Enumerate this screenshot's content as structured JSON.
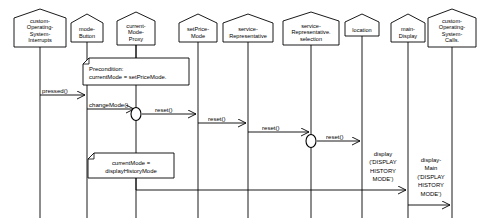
{
  "diagram": {
    "type": "sequence-diagram",
    "background_color": "#ffffff",
    "line_color": "#000000"
  },
  "objects": [
    {
      "id": "cosi",
      "label_lines": [
        "custom-",
        "Operating-",
        "System-",
        "Interrupts"
      ],
      "x": 40,
      "box_w": 52,
      "box_h": 38
    },
    {
      "id": "modebutton",
      "label_lines": [
        "mode-",
        "Button"
      ],
      "x": 87,
      "box_w": 32,
      "box_h": 28
    },
    {
      "id": "modeproxy",
      "label_lines": [
        "current-",
        "Mode-",
        "Proxy"
      ],
      "x": 136,
      "box_w": 38,
      "box_h": 33
    },
    {
      "id": "setprice",
      "label_lines": [
        "setPrice-",
        "Mode"
      ],
      "x": 198,
      "box_w": 38,
      "box_h": 28
    },
    {
      "id": "servicerep",
      "label_lines": [
        "service-",
        "Representative"
      ],
      "x": 248,
      "box_w": 50,
      "box_h": 28
    },
    {
      "id": "servicesel",
      "label_lines": [
        "service-",
        "Representative.",
        "selection"
      ],
      "x": 311,
      "box_w": 56,
      "box_h": 33
    },
    {
      "id": "location",
      "label_lines": [
        "location"
      ],
      "x": 362,
      "box_w": 34,
      "box_h": 22
    },
    {
      "id": "maindisplay",
      "label_lines": [
        "main-",
        "Display"
      ],
      "x": 408,
      "box_w": 34,
      "box_h": 28
    },
    {
      "id": "cosc",
      "label_lines": [
        "custom-",
        "Operating-",
        "System-",
        "Calls."
      ],
      "x": 452,
      "box_w": 48,
      "box_h": 38
    }
  ],
  "messages": [
    {
      "id": "pressed",
      "label": "pressed()",
      "from": "cosi",
      "to": "modebutton",
      "y": 95,
      "orientation": "horizontal"
    },
    {
      "id": "changemode",
      "label": "changeMode()",
      "from": "modebutton",
      "to": "modeproxy",
      "y": 104,
      "orientation": "horizontal"
    },
    {
      "id": "reset1",
      "label": "reset()",
      "from": "modeproxy",
      "to": "setprice",
      "y": 113,
      "orientation": "horizontal"
    },
    {
      "id": "reset2",
      "label": "reset()",
      "from": "setprice",
      "to": "servicerep",
      "y": 124,
      "orientation": "horizontal"
    },
    {
      "id": "reset3",
      "label": "reset()",
      "from": "servicerep",
      "to": "servicesel",
      "y": 133,
      "orientation": "horizontal"
    },
    {
      "id": "reset4",
      "label": "reset()",
      "from": "servicesel",
      "to": "location",
      "y": 141,
      "orientation": "horizontal"
    },
    {
      "id": "display",
      "label_lines": [
        "display",
        "('DISPLAY",
        "HISTORY",
        "MODE')"
      ],
      "from": "modeproxy",
      "to": "maindisplay",
      "y": 188,
      "orientation": "horizontal"
    },
    {
      "id": "displaymain",
      "label_lines": [
        "display-",
        "Main",
        "('DISPLAY",
        "HISTORY",
        "MODE')"
      ],
      "from": "maindisplay",
      "to": "cosc",
      "y": 200,
      "orientation": "horizontal"
    }
  ],
  "notes": [
    {
      "id": "precondition-note",
      "lines": [
        "Precondition:",
        "currentMode = setPriceMode."
      ],
      "x": 83,
      "y": 58,
      "w": 106,
      "h": 27,
      "anchor_lifeline": "modeproxy"
    },
    {
      "id": "currentmode-note",
      "lines": [
        "currentMode =",
        "displayHistoryMode"
      ],
      "x": 88,
      "y": 153,
      "w": 86,
      "h": 25,
      "anchor_lifeline": "modeproxy"
    }
  ],
  "activation_marks": [
    {
      "id": "mark-modeproxy",
      "lifeline": "modeproxy",
      "y": 113,
      "rx": 5,
      "ry": 6.5
    },
    {
      "id": "mark-servicesel",
      "lifeline": "servicesel",
      "y": 141,
      "rx": 5,
      "ry": 6.5
    }
  ],
  "lifelines": {
    "top_y_offsets": "below each object box",
    "bottom_y": 218
  }
}
